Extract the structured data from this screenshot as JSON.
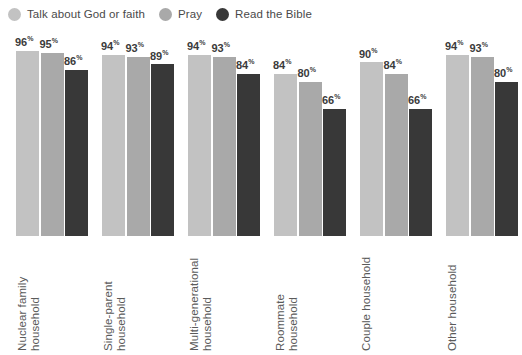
{
  "legend": {
    "items": [
      {
        "label": "Talk about God or faith",
        "color": "#c2c2c2",
        "icon": "circle-icon"
      },
      {
        "label": "Pray",
        "color": "#a9a9a9",
        "icon": "circle-icon"
      },
      {
        "label": "Read the Bible",
        "color": "#383838",
        "icon": "circle-icon"
      }
    ]
  },
  "chart_data": {
    "type": "bar",
    "title": "",
    "xlabel": "",
    "ylabel": "",
    "ylim": [
      0,
      100
    ],
    "grid": false,
    "legend_position": "top-left",
    "value_suffix": "%",
    "categories": [
      "Nuclear family household",
      "Single-parent household",
      "Multi-generational household",
      "Roommate household",
      "Couple household",
      "Other household"
    ],
    "category_lines": [
      [
        "Nuclear family",
        "household"
      ],
      [
        "Single-parent",
        "household"
      ],
      [
        "Multi-generational",
        "household"
      ],
      [
        "Roommate",
        "household"
      ],
      [
        "Couple household"
      ],
      [
        "Other household"
      ]
    ],
    "series": [
      {
        "name": "Talk about God or faith",
        "color": "#c2c2c2",
        "values": [
          96,
          94,
          94,
          84,
          90,
          94
        ]
      },
      {
        "name": "Pray",
        "color": "#a9a9a9",
        "values": [
          95,
          93,
          93,
          80,
          84,
          93
        ]
      },
      {
        "name": "Read the Bible",
        "color": "#383838",
        "values": [
          86,
          89,
          84,
          66,
          66,
          80
        ]
      }
    ],
    "labels": [
      [
        "96%",
        "95%",
        "86%"
      ],
      [
        "94%",
        "93%",
        "89%"
      ],
      [
        "94%",
        "93%",
        "84%"
      ],
      [
        "84%",
        "80%",
        "66%"
      ],
      [
        "90%",
        "84%",
        "66%"
      ],
      [
        "94%",
        "93%",
        "80%"
      ]
    ]
  }
}
